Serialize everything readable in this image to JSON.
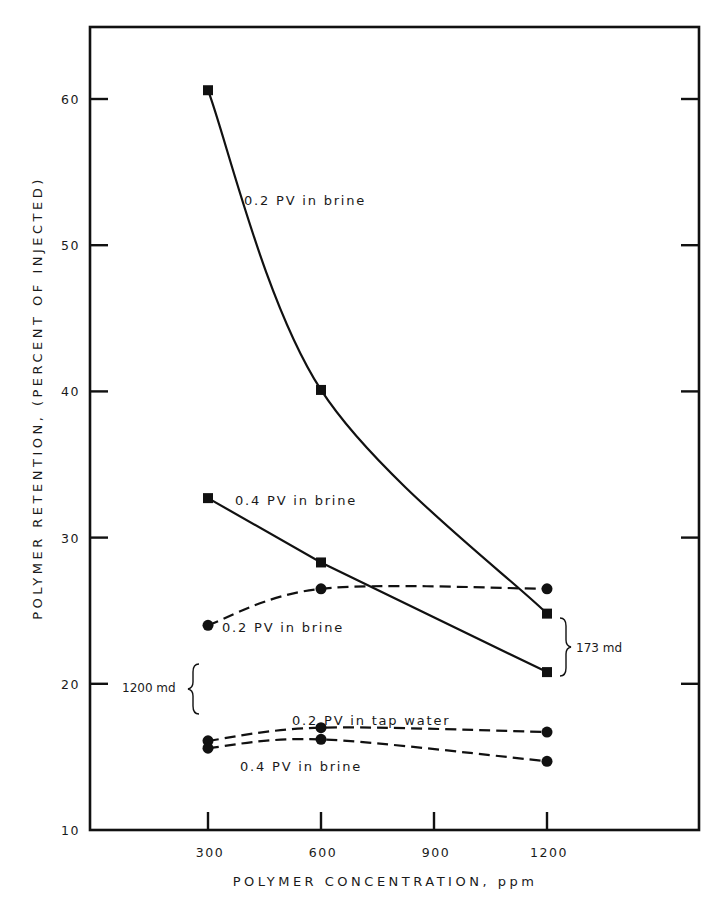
{
  "chart_data": {
    "type": "line",
    "title": "",
    "xlabel": "POLYMER  CONCENTRATION, ppm",
    "ylabel": "POLYMER  RETENTION,  (PERCENT  OF  INJECTED)",
    "xlim": [
      0,
      1650
    ],
    "ylim": [
      10,
      65
    ],
    "x_ticks": [
      300,
      600,
      900,
      1200
    ],
    "x_tick_labels": [
      "300",
      "600",
      "900",
      "1200"
    ],
    "y_ticks": [
      10,
      20,
      30,
      40,
      50,
      60
    ],
    "y_tick_labels": [
      "10",
      "20",
      "30",
      "40",
      "50",
      "60"
    ],
    "grid": false,
    "legend": "none (series labelled inline)",
    "series": [
      {
        "name": "0.2 PV in brine",
        "core": "173 md",
        "marker": "square",
        "line_style": "solid",
        "x": [
          300,
          600,
          1200
        ],
        "values": [
          60.6,
          40.1,
          24.8
        ],
        "label_pos": [
          244,
          205
        ]
      },
      {
        "name": "0.4 PV in brine",
        "core": "173 md",
        "marker": "square",
        "line_style": "solid",
        "x": [
          300,
          600,
          1200
        ],
        "values": [
          32.7,
          28.3,
          20.8
        ],
        "label_pos": [
          235,
          505
        ]
      },
      {
        "name": "0.2 PV in brine",
        "core": "1200 md",
        "marker": "circle",
        "line_style": "dashed",
        "x": [
          300,
          600,
          1200
        ],
        "values": [
          24.0,
          26.5,
          26.5
        ],
        "label_pos": [
          222,
          632
        ]
      },
      {
        "name": "0.2 PV in tap water",
        "core": "1200 md",
        "marker": "circle",
        "line_style": "dashed",
        "x": [
          300,
          600,
          1200
        ],
        "values": [
          16.1,
          17.0,
          16.7
        ],
        "label_pos": [
          292,
          725
        ]
      },
      {
        "name": "0.4 PV in brine",
        "core": "1200 md",
        "marker": "circle",
        "line_style": "dashed",
        "x": [
          300,
          600,
          1200
        ],
        "values": [
          15.6,
          16.2,
          14.7
        ],
        "label_pos": [
          240,
          771
        ]
      }
    ],
    "annotations": [
      {
        "text": "173 md",
        "type": "brace",
        "applies_to": "square-marker series (solid lines)"
      },
      {
        "text": "1200 md",
        "type": "brace",
        "applies_to": "circle-marker series (dashed lines)"
      }
    ]
  },
  "annotations": {
    "md173": "173 md",
    "md1200": "1200 md"
  },
  "axis": {
    "xlabel": "POLYMER  CONCENTRATION, ppm",
    "ylabel": "POLYMER  RETENTION,  (PERCENT  OF  INJECTED)"
  }
}
